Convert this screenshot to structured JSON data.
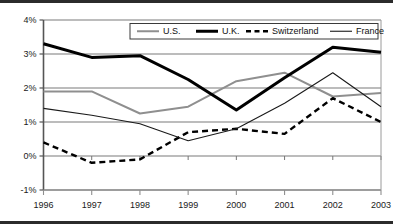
{
  "chart_data": {
    "type": "line",
    "title": "",
    "subtitle": "",
    "xlabel": "",
    "ylabel": "",
    "categories": [
      "1996",
      "1997",
      "1998",
      "1999",
      "2000",
      "2001",
      "2002",
      "2003"
    ],
    "x": [
      1996,
      1997,
      1998,
      1999,
      2000,
      2001,
      2002,
      2003
    ],
    "ylim": [
      -1,
      4
    ],
    "xlim": [
      1996,
      2003
    ],
    "yticks": [
      -1,
      0,
      1,
      2,
      3,
      4
    ],
    "ytick_labels": [
      "-1%",
      "0%",
      "1%",
      "2%",
      "3%",
      "4%"
    ],
    "xtick_labels": [
      "1996",
      "1997",
      "1998",
      "1999",
      "2000",
      "2001",
      "2002",
      "2003"
    ],
    "grid": true,
    "grid_axis": "y",
    "legend_position": "top-center",
    "value_unit": "percent",
    "series": [
      {
        "name": "U.S.",
        "color": "#8f8f8f",
        "style": "solid",
        "width": 2,
        "values": [
          1.9,
          1.9,
          1.25,
          1.45,
          2.2,
          2.45,
          1.75,
          1.85
        ]
      },
      {
        "name": "U.K.",
        "color": "#000000",
        "style": "solid",
        "width": 3,
        "values": [
          3.3,
          2.9,
          2.95,
          2.25,
          1.35,
          2.3,
          3.2,
          3.05
        ]
      },
      {
        "name": "Switzerland",
        "color": "#000000",
        "style": "dashed",
        "width": 2.4,
        "values": [
          0.4,
          -0.2,
          -0.1,
          0.7,
          0.8,
          0.65,
          1.7,
          1.0
        ]
      },
      {
        "name": "France",
        "color": "#1a1a1a",
        "style": "solid",
        "width": 1.1,
        "values": [
          1.4,
          1.2,
          0.95,
          0.45,
          0.8,
          1.55,
          2.45,
          1.45
        ]
      }
    ]
  },
  "axes": {
    "y_axis_color": "#555555",
    "x_axis_color": "#8f8f8f",
    "gridline_color": "#a6a6a6",
    "plot_background": "#ffffff"
  },
  "frame": {
    "top_rule_color": "#2b2b2b",
    "bottom_rule_color": "#2b2b2b"
  }
}
